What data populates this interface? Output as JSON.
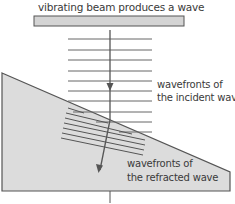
{
  "title": "vibrating beam produces a wave",
  "labels": {
    "incident_line1": "wavefronts of",
    "incident_line2": "the incident wave",
    "refracted_line1": "wavefronts of",
    "refracted_line2": "the refracted wave"
  },
  "colors": {
    "beam_fill": "#d4d4d4",
    "wedge_fill": "#dcdcdc",
    "line": "#555555"
  },
  "incident_wavefronts_count": 9,
  "refracted_wavefronts_count": 7
}
